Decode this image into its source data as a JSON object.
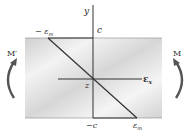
{
  "diagram": {
    "axis_y_label": "y",
    "axis_x_label": "ε",
    "axis_x_sub": "x",
    "origin_label": "z",
    "top_label": "c",
    "bottom_label": "−c",
    "top_strain_label": "− ε",
    "top_strain_sub": "m",
    "bottom_strain_label": "ε",
    "bottom_strain_sub": "m",
    "left_moment_label": "M′",
    "right_moment_label": "M"
  },
  "colors": {
    "beam_fill": "#d9d9d9",
    "beam_light": "#f2f2f2",
    "line": "#333333",
    "arrow": "#555555"
  }
}
